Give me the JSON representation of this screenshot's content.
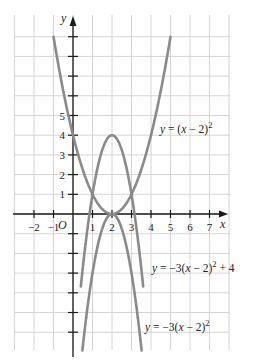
{
  "chart_data": {
    "type": "line",
    "title": "",
    "xlabel": "x",
    "ylabel": "y",
    "origin_label": "O",
    "xlim": [
      -3,
      7.5
    ],
    "ylim": [
      -7,
      9.5
    ],
    "grid": true,
    "x_ticks": [
      -2,
      -1,
      1,
      2,
      3,
      4,
      5,
      6,
      7
    ],
    "x_tick_labels": [
      "−2",
      "−1",
      "1",
      "2",
      "3",
      "4",
      "5",
      "6",
      "7"
    ],
    "y_ticks_labeled": [
      1,
      2,
      3,
      4,
      5
    ],
    "y_tick_labels": [
      "1",
      "2",
      "3",
      "4",
      "5"
    ],
    "y_ticks_unlabeled": [
      6,
      7,
      8,
      9,
      -1,
      -2,
      -3,
      -4,
      -5,
      -6
    ],
    "series": [
      {
        "name": "y = (x − 2)²",
        "equation": "(x-2)^2",
        "x_range": [
          -1,
          5
        ],
        "points": [
          [
            -1,
            9
          ],
          [
            0,
            4
          ],
          [
            1,
            1
          ],
          [
            2,
            0
          ],
          [
            3,
            1
          ],
          [
            4,
            4
          ],
          [
            5,
            9
          ]
        ]
      },
      {
        "name": "y = −3(x − 2)² + 4",
        "equation": "-3*(x-2)^2+4",
        "x_range": [
          0.4,
          3.6
        ],
        "points": [
          [
            0.4,
            -3.68
          ],
          [
            1,
            1
          ],
          [
            2,
            4
          ],
          [
            3,
            1
          ],
          [
            3.6,
            -3.68
          ]
        ]
      },
      {
        "name": "y = −3(x − 2)²",
        "equation": "-3*(x-2)^2",
        "x_range": [
          0.48,
          3.52
        ],
        "points": [
          [
            0.48,
            -6.93
          ],
          [
            1,
            -3
          ],
          [
            2,
            0
          ],
          [
            3,
            -3
          ],
          [
            3.52,
            -6.93
          ]
        ]
      }
    ],
    "annotations": [
      {
        "text": "y = (x − 2)²",
        "near": [
          5,
          4
        ]
      },
      {
        "text": "y = −3(x − 2)² + 4",
        "near": [
          4,
          -3
        ]
      },
      {
        "text": "y = −3(x − 2)²",
        "near": [
          4,
          -5.5
        ]
      }
    ]
  },
  "labels": {
    "y_axis": "y",
    "x_axis": "x",
    "origin": "O",
    "eq1": {
      "pre": "y",
      "mid": " = (",
      "x": "x",
      "post": " − 2)",
      "exp": "2"
    },
    "eq2": {
      "pre": "y",
      "mid": " = −3(",
      "x": "x",
      "post": " − 2)",
      "exp": "2",
      "tail": " + 4"
    },
    "eq3": {
      "pre": "y",
      "mid": " = −3(",
      "x": "x",
      "post": " − 2)",
      "exp": "2"
    }
  },
  "colors": {
    "curve": "#8a8a8a",
    "grid": "#d4d4d4",
    "axis": "#1a1a1a"
  }
}
